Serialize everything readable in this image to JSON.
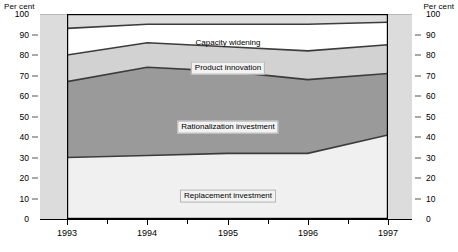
{
  "axes": {
    "left_unit_label": "Per cent",
    "right_unit_label": "Per cent",
    "y_ticks": [
      "100",
      "90",
      "80",
      "70",
      "60",
      "50",
      "40",
      "30",
      "20",
      "10",
      "0"
    ],
    "x_ticks": [
      "1993",
      "1994",
      "1995",
      "1996",
      "1997"
    ]
  },
  "series_labels": {
    "capacity_widening": "Capacity widening",
    "product_innovation": "Product innovation",
    "rationalization_investment": "Rationalization investment",
    "replacement_investment": "Replacement investment"
  },
  "colors": {
    "backdrop": "#dcdcdc",
    "replacement": "#f0f0f0",
    "rationalization": "#9a9a9a",
    "product_innovation": "#d2d2d2",
    "capacity_widening": "#ffffff",
    "series_outline": "#3c3c3c",
    "frame": "#000000"
  },
  "chart_data": {
    "type": "area",
    "title": "",
    "subtitle": "",
    "xlabel": "",
    "ylabel": "Per cent",
    "ylim": [
      0,
      100
    ],
    "ytick_step": 10,
    "grid": false,
    "legend": "in-plot labels",
    "stacked": true,
    "stack_order_bottom_to_top": [
      "Replacement investment",
      "Rationalization investment",
      "Product innovation",
      "Capacity widening"
    ],
    "x": [
      "1993",
      "1994",
      "1995",
      "1996",
      "1997"
    ],
    "series": [
      {
        "name": "Replacement investment",
        "values": [
          30,
          31,
          32,
          32,
          41
        ],
        "cumulative_top": [
          30,
          31,
          32,
          32,
          41
        ]
      },
      {
        "name": "Rationalization investment",
        "values": [
          37,
          43,
          40,
          36,
          30
        ],
        "cumulative_top": [
          67,
          74,
          72,
          68,
          71
        ]
      },
      {
        "name": "Product innovation",
        "values": [
          13,
          12,
          12,
          14,
          14
        ],
        "cumulative_top": [
          80,
          86,
          84,
          82,
          85
        ]
      },
      {
        "name": "Capacity widening",
        "values": [
          13,
          9,
          11,
          13,
          11
        ],
        "cumulative_top": [
          93,
          95,
          95,
          95,
          96
        ]
      }
    ]
  }
}
